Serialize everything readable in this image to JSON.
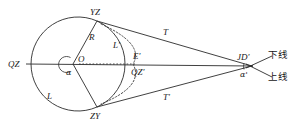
{
  "figure": {
    "type": "geometry-diagram",
    "title": "",
    "colors": {
      "stroke": "#2b2b2b",
      "dashed": "#3a3a3a",
      "text": "#1a1a1a",
      "background": "#ffffff"
    },
    "labels": {
      "qz": "QZ",
      "yz": "YZ",
      "zy": "ZY",
      "o": "O",
      "r": "R",
      "l": "L",
      "l_prime": "L'",
      "e_prime": "E'",
      "qz_prime": "QZ'",
      "t": "T",
      "t_prime": "T'",
      "jd_prime": "JD'",
      "alpha": "α",
      "alpha_prime": "α'",
      "lower_line_cn": "下线",
      "upper_line_cn": "上线"
    },
    "geometry": {
      "center": {
        "x": 73,
        "y": 64
      },
      "radius": 47,
      "apex": {
        "x": 252,
        "y": 66
      },
      "point_yz": {
        "x": 97,
        "y": 21
      },
      "point_zy": {
        "x": 97,
        "y": 107
      },
      "point_qz": {
        "x": 26,
        "y": 64
      },
      "point_e_prime": {
        "x": 133,
        "y": 64
      }
    }
  }
}
